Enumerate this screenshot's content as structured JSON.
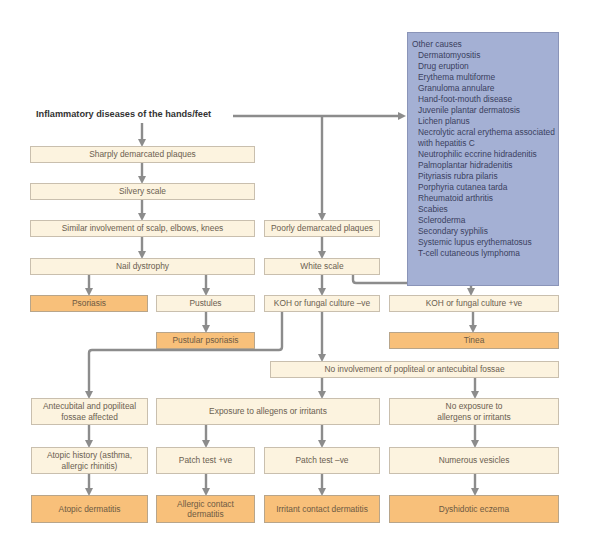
{
  "title": "Inflammatory diseases of the hands/feet",
  "other_causes": {
    "heading": "Other causes",
    "items": [
      "Dermatomyositis",
      "Drug eruption",
      "Erythema multiforme",
      "Granuloma annulare",
      "Hand-foot-mouth disease",
      "Juvenile plantar dermatosis",
      "Lichen planus",
      "Necrolytic acral erythema  associated",
      "with hepatitis C",
      "Neutrophilic eccrine hidradenitis",
      "Palmoplantar hidradenitis",
      "Pityriasis rubra pilaris",
      "Porphyria cutanea tarda",
      "Rheumatoid arthritis",
      "Scabies",
      "Scleroderma",
      "Secondary syphilis",
      "Systemic lupus erythematosus",
      "T-cell cutaneous lymphoma"
    ]
  },
  "nodes": {
    "sharply_demarcated": "Sharply demarcated plaques",
    "silvery_scale": "Silvery scale",
    "similar_involvement": "Similar involvement of scalp, elbows, knees",
    "nail_dystrophy": "Nail dystrophy",
    "psoriasis": "Psoriasis",
    "pustules": "Pustules",
    "pustular_psoriasis": "Pustular psoriasis",
    "poorly_demarcated": "Poorly demarcated plaques",
    "white_scale": "White scale",
    "koh_neg": "KOH or fungal culture –ve",
    "koh_pos": "KOH or fungal culture +ve",
    "tinea": "Tinea",
    "no_involvement": "No involvement of popliteal or antecubital fossae",
    "antecubital": "Antecubital and popiliteal fossae affected",
    "exposure": "Exposure to allegens or irritants",
    "no_exposure": "No exposure to allergens or irritants",
    "atopic_history": "Atopic history (asthma, allergic rhinitis)",
    "patch_pos": "Patch test +ve",
    "patch_neg": "Patch test –ve",
    "numerous_vesicles": "Numerous vesicles",
    "atopic_dermatitis": "Atopic dermatitis",
    "allergic_contact": "Allergic contact dermatitis",
    "irritant_contact": "Irritant contact dermatitis",
    "dyshidrotic": "Dyshidotic eczema"
  },
  "colors": {
    "condition_fill": "#fcf3df",
    "diagnosis_fill": "#f8c07a",
    "other_causes_fill": "#a4b0d4",
    "connector": "#8c8c8c"
  }
}
